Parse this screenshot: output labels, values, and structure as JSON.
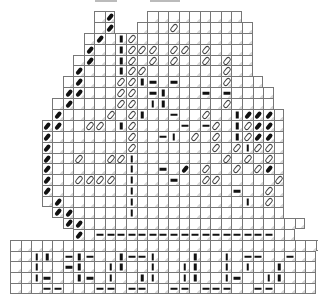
{
  "pattern": {
    "description": "Bead/stitch chart grid",
    "cell_size_px": [
      10.55,
      10.9
    ],
    "legend": {
      " ": "no-cell",
      ".": "blank-cell",
      "B": "black-diagonal-bead",
      "o": "hollow-oval-bead",
      "-": "horizontal-dash",
      "|": "vertical-dash"
    },
    "rows": [
      "        .B   .........       ",
      "        .B  ...o.......      ",
      "       .B.|o...........      ",
      "       B..|ooo.oo.o....      ",
      "      .B..|o.o.o..o.o..      ",
      "      B...|oo.......o..      ",
      "     .B...oo|-.-....o...     ",
      "     BB...oo.-|...-.-....    ",
      "    .B....oo.||.....o....    ",
      "    B....o.o|..-..o..|BBB.   ",
      "   BB..oo.|o....-.-o.|oBB.   ",
      "   B.......o..-|.o.o.|oBB.   ",
      "   B.......o.......o.o|oo.   ",
      "   B..o..oo|........o.o.o.   ",
      "   B.......|..-.B.o..o.oB.   ",
      "   B..oooo.|...-..oo.....o   ",
      "   B.......|.........-..o.   ",
      "   .B......|..........|.o.   ",
      "    BB.....|..............   ",
      "     BB.....................",
      "      B.-----------------.. ",
      "..............................",
      "..||.-|-..|--|...|..|.--..-..",
      "..|..-|..||..|..||..|.|..|...",
      "..|-..|-.|..||..||..|-..||...",
      "...--...--.--..--.---..--...."
    ]
  },
  "top_marks": [
    {
      "x": 95,
      "w": 22
    },
    {
      "x": 150,
      "w": 30
    }
  ]
}
